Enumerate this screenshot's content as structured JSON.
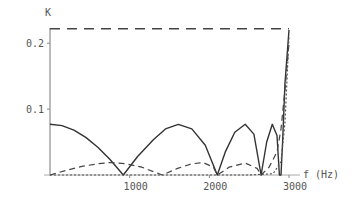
{
  "chart_data": {
    "type": "line",
    "title": "",
    "xlabel": "f (Hz)",
    "ylabel": "K",
    "xlim": [
      0,
      3050
    ],
    "ylim": [
      0,
      0.225
    ],
    "xticks": [
      1000,
      2000,
      3000
    ],
    "xtick_labels": [
      "1000",
      "2000",
      "3000"
    ],
    "yticks": [
      0.1,
      0.2
    ],
    "ytick_labels": [
      "0.1",
      "0.2"
    ],
    "grid": false,
    "legend": "none",
    "series": [
      {
        "name": "solid",
        "style": "solid",
        "x": [
          0,
          150,
          300,
          450,
          600,
          750,
          920,
          1100,
          1300,
          1450,
          1610,
          1780,
          1950,
          2100,
          2200,
          2320,
          2450,
          2560,
          2650,
          2720,
          2790,
          2850,
          2880,
          2900,
          2920,
          2950,
          3000
        ],
        "y": [
          0.077,
          0.075,
          0.068,
          0.057,
          0.042,
          0.024,
          0.0,
          0.028,
          0.054,
          0.07,
          0.077,
          0.07,
          0.045,
          0.0,
          0.035,
          0.065,
          0.077,
          0.062,
          0.0,
          0.05,
          0.077,
          0.06,
          0.0,
          0.0,
          0.05,
          0.14,
          0.22
        ]
      },
      {
        "name": "dashed",
        "style": "dashed",
        "x": [
          0,
          200,
          400,
          600,
          760,
          950,
          1150,
          1410,
          1600,
          1780,
          1920,
          2050,
          2100,
          2250,
          2450,
          2600,
          2650,
          2750,
          2850,
          2900,
          2950,
          3000
        ],
        "y": [
          0.0,
          0.007,
          0.013,
          0.017,
          0.019,
          0.017,
          0.012,
          0.0,
          0.01,
          0.017,
          0.019,
          0.012,
          0.0,
          0.012,
          0.018,
          0.01,
          0.0,
          0.012,
          0.035,
          0.07,
          0.13,
          0.2
        ]
      },
      {
        "name": "dotted",
        "style": "dotted",
        "x": [
          0,
          500,
          1000,
          1500,
          2000,
          2500,
          2800,
          2900,
          2950,
          3000
        ],
        "y": [
          0.0,
          0.0,
          0.0,
          0.0,
          0.0,
          0.0,
          0.002,
          0.02,
          0.08,
          0.21
        ]
      },
      {
        "name": "upper-dashed",
        "style": "long-dashed",
        "x": [
          0,
          3000
        ],
        "y": [
          0.222,
          0.222
        ]
      }
    ]
  }
}
